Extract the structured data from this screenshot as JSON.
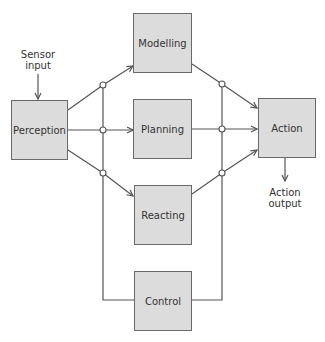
{
  "diagram": {
    "nodes": {
      "perception": "Perception",
      "modelling": "Modelling",
      "planning": "Planning",
      "reacting": "Reacting",
      "control": "Control",
      "action": "Action"
    },
    "labels": {
      "sensor_input_line1": "Sensor",
      "sensor_input_line2": "input",
      "action_output_line1": "Action",
      "action_output_line2": "output"
    },
    "edges": [
      {
        "from": "Sensor input",
        "to": "Perception"
      },
      {
        "from": "Perception",
        "to": "Modelling"
      },
      {
        "from": "Perception",
        "to": "Planning"
      },
      {
        "from": "Perception",
        "to": "Reacting"
      },
      {
        "from": "Modelling",
        "to": "Action"
      },
      {
        "from": "Planning",
        "to": "Action"
      },
      {
        "from": "Reacting",
        "to": "Action"
      },
      {
        "from": "Control",
        "to": "left bus"
      },
      {
        "from": "Control",
        "to": "right bus"
      },
      {
        "from": "Action",
        "to": "Action output"
      }
    ],
    "colors": {
      "box_fill": "#dcdcdc",
      "box_border": "#6a6a6a",
      "line": "#555555"
    }
  }
}
